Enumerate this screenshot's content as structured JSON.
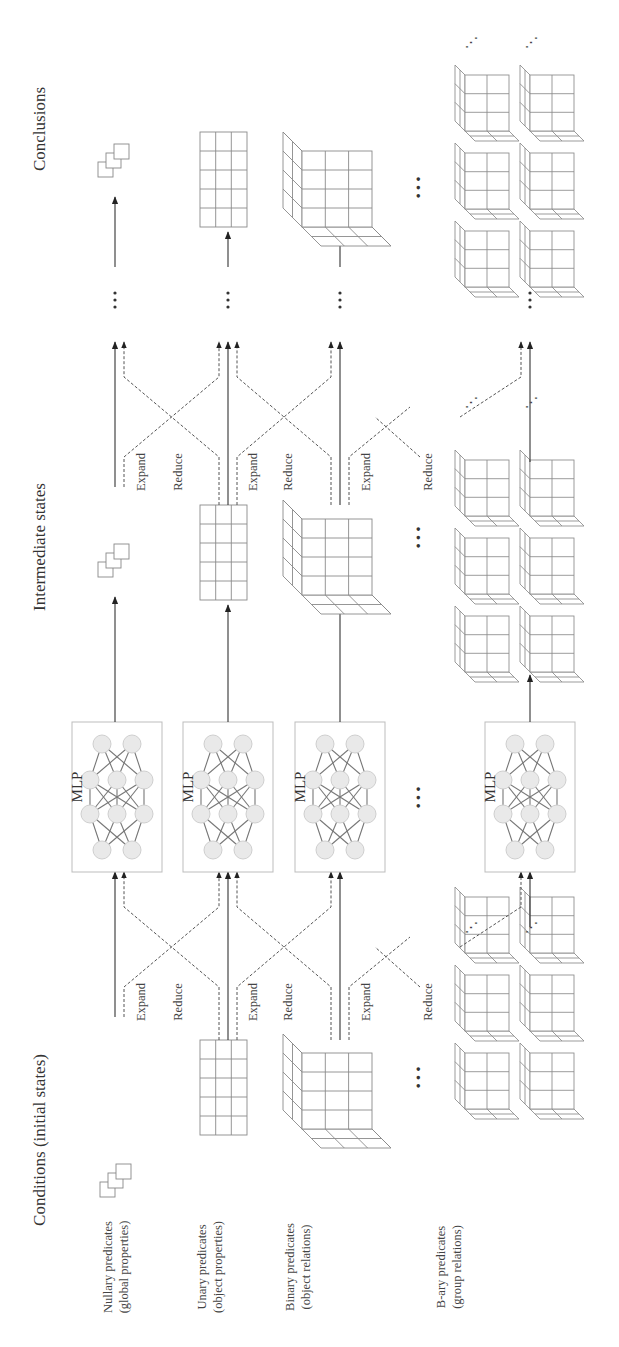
{
  "titles": {
    "conditions": "Conditions (initial states)",
    "intermediate": "Intermediate states",
    "conclusions": "Conclusions"
  },
  "rows": [
    {
      "line1": "Nullary predicates",
      "line2": "(global properties)"
    },
    {
      "line1": "Unary predicates",
      "line2": "(object properties)"
    },
    {
      "line1": "Binary predicates",
      "line2": "(object relations)"
    },
    {
      "line1": "B-ary predicates",
      "line2": "(group relations)"
    }
  ],
  "ops": {
    "expand": "Expand",
    "reduce": "Reduce"
  },
  "mlp_label": "MLP",
  "ellipsis": "···",
  "small_ellipsis": "⋱",
  "colors": {
    "line": "#333333",
    "grid": "#8a8a8a",
    "node_fill": "#e9e9e9",
    "node_stroke": "#c8c8c8",
    "box": "#bdbdbd"
  }
}
